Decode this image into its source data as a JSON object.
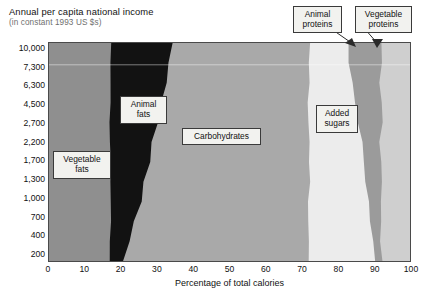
{
  "header": {
    "title": "Annual per capita national income",
    "subtitle": "(in constant 1993 US $s)"
  },
  "chart_data": {
    "type": "area",
    "title": "Annual per capita national income",
    "subtitle": "(in constant 1993 US $s)",
    "xlabel": "Percentage of total calories",
    "ylabel": "Annual per capita national income (in constant 1993 US $s)",
    "orientation": "horizontal-stacked",
    "grid": false,
    "legend": "in-plot-labels",
    "xlim": [
      0,
      100
    ],
    "xticks": [
      0,
      10,
      20,
      30,
      40,
      50,
      60,
      70,
      80,
      90,
      100
    ],
    "yticks": [
      "10,000",
      "7,300",
      "6,300",
      "4,500",
      "2,700",
      "2,200",
      "1,700",
      "1,300",
      "1,000",
      "700",
      "400",
      "200"
    ],
    "y_axis_note": "income strata, highest at top, non-linear spacing",
    "series": [
      {
        "name": "Vegetable fats",
        "color": "#8f8f8f",
        "cumulative_upper_by_income": [
          17,
          17,
          17,
          17,
          17,
          17,
          17,
          17,
          17,
          17,
          17,
          17
        ]
      },
      {
        "name": "Animal fats",
        "color": "#121212",
        "cumulative_upper_by_income": [
          34,
          33,
          32,
          31,
          29.5,
          28.5,
          27.5,
          26.5,
          25.5,
          24,
          22.5,
          21
        ]
      },
      {
        "name": "Carbohydrates",
        "color": "#a9a9a9",
        "cumulative_upper_by_income": [
          72,
          72,
          72,
          72,
          72,
          72,
          72,
          72,
          72,
          72,
          72,
          72
        ]
      },
      {
        "name": "Added sugars",
        "color": "#ececec",
        "cumulative_upper_by_income": [
          83,
          83.5,
          84,
          84.5,
          85.5,
          86.5,
          87.5,
          88,
          88.5,
          89,
          89.5,
          90
        ]
      },
      {
        "name": "Animal proteins",
        "color": "#9b9b9b",
        "cumulative_upper_by_income": [
          92,
          92,
          92,
          92,
          92,
          92,
          92,
          92,
          92,
          92,
          92,
          92
        ]
      },
      {
        "name": "Vegetable proteins",
        "color": "#cfcfcf",
        "cumulative_upper_by_income": [
          100,
          100,
          100,
          100,
          100,
          100,
          100,
          100,
          100,
          100,
          100,
          100
        ]
      }
    ],
    "labels": {
      "vegetable_fats": "Vegetable\nfats",
      "animal_fats": "Animal\nfats",
      "carbohydrates": "Carbohydrates",
      "added_sugars": "Added\nsugars",
      "animal_proteins": "Animal\nproteins",
      "vegetable_proteins": "Vegetable\nproteins"
    }
  }
}
